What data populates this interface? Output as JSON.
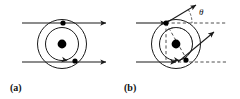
{
  "figure": {
    "title": "",
    "background_color": "#ffffff",
    "stroke_color": "#1a1a1a",
    "dash_color": "#3a3a3a",
    "nucleus_color": "#000000",
    "particle_color": "#000000",
    "width": 240,
    "height": 99
  },
  "panels": [
    {
      "id": "a",
      "label": "(a)",
      "label_x": 10,
      "label_y": 91,
      "center_x": 62,
      "center_y": 44,
      "nucleus_radius": 4.4,
      "orbits": [
        {
          "name": "outer-orbit",
          "radius": 24.5,
          "style": "solid"
        },
        {
          "name": "inner-orbit",
          "radius": 16.5,
          "style": "solid"
        }
      ],
      "rays": [
        {
          "name": "upper-incoming-ray",
          "x1": 22,
          "y1": 23,
          "x2": 106,
          "y2": 23,
          "style": "solid",
          "arrow_end": true
        },
        {
          "name": "lower-incoming-ray",
          "x1": 22,
          "y1": 62,
          "x2": 106,
          "y2": 62,
          "style": "solid",
          "arrow_end": true
        }
      ],
      "particles": [
        {
          "name": "upper-particle",
          "x": 63,
          "y": 23,
          "radius": 2.6
        },
        {
          "name": "lower-particle",
          "x": 75,
          "y": 61,
          "radius": 2.6
        }
      ],
      "orbit_arrows": [
        {
          "name": "inner-orbit-direction-arrow",
          "x": 66,
          "y": 60.2,
          "angle": 10
        }
      ]
    },
    {
      "id": "b",
      "label": "(b)",
      "label_x": 124,
      "label_y": 91,
      "center_x": 176,
      "center_y": 44,
      "nucleus_radius": 4.4,
      "orbits": [
        {
          "name": "outer-orbit",
          "radius": 24.5,
          "style": "solid"
        },
        {
          "name": "inner-orbit",
          "radius": 16.5,
          "style": "solid"
        }
      ],
      "rays": [
        {
          "name": "upper-incoming-ray",
          "x1": 136,
          "y1": 23,
          "x2": 166,
          "y2": 23,
          "style": "solid",
          "arrow_end": true
        },
        {
          "name": "lower-incoming-ray",
          "x1": 136,
          "y1": 62,
          "x2": 176,
          "y2": 62,
          "style": "solid",
          "arrow_end": true
        },
        {
          "name": "upper-outgoing-ray",
          "x1": 166,
          "y1": 23,
          "x2": 196,
          "y2": 5,
          "style": "solid",
          "arrow_end": true
        },
        {
          "name": "lower-outgoing-ray",
          "x1": 178,
          "y1": 62,
          "x2": 214,
          "y2": 32,
          "style": "solid",
          "arrow_end": true
        }
      ],
      "dashed_refs": [
        {
          "name": "upper-reference-axis",
          "x1": 166,
          "y1": 23,
          "x2": 226,
          "y2": 23,
          "style": "dashed"
        },
        {
          "name": "lower-reference-axis",
          "x1": 178,
          "y1": 62,
          "x2": 226,
          "y2": 62,
          "style": "dashed"
        },
        {
          "name": "vertical-chord",
          "x1": 166,
          "y1": 23,
          "x2": 166,
          "y2": 62,
          "style": "dashed"
        },
        {
          "name": "scattering-chord",
          "x1": 166,
          "y1": 23,
          "x2": 186,
          "y2": 58,
          "style": "dashed"
        }
      ],
      "dashed_arcs": [
        {
          "name": "inner-dashed-orbit-arc",
          "cx": 176,
          "cy": 44,
          "r": 16.5,
          "start_deg": -125,
          "end_deg": 35
        }
      ],
      "particles": [
        {
          "name": "upper-particle",
          "x": 166,
          "y": 23,
          "radius": 2.6
        },
        {
          "name": "lower-particle",
          "x": 186,
          "y": 60,
          "radius": 2.6
        }
      ],
      "orbit_arrows": [
        {
          "name": "inner-orbit-direction-arrow",
          "x": 178,
          "y": 60.4,
          "angle": 8
        }
      ],
      "angle_marker": {
        "name": "theta-angle-arc",
        "vertex_x": 166,
        "vertex_y": 23,
        "radius": 26,
        "start_deg": -31,
        "end_deg": 0
      },
      "theta": {
        "symbol": "θ",
        "x": 199,
        "y": 15
      }
    }
  ]
}
